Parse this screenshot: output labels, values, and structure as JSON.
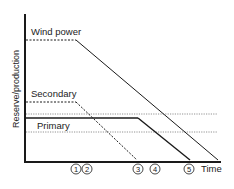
{
  "diagram": {
    "y_axis_label": "Reserve/production",
    "x_axis_label": "Time",
    "series": {
      "wind": {
        "label": "Wind power"
      },
      "secondary": {
        "label": "Secondary"
      },
      "primary": {
        "label": "Primary"
      }
    },
    "markers": [
      {
        "label": "1"
      },
      {
        "label": "2"
      },
      {
        "label": "3"
      },
      {
        "label": "4"
      },
      {
        "label": "5"
      }
    ],
    "colors": {
      "line": "#1a1a1a",
      "dotted": "#777777",
      "background": "#ffffff"
    }
  }
}
